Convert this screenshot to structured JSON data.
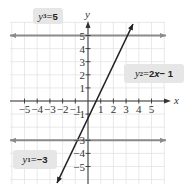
{
  "chart_data": {
    "type": "line",
    "title": "",
    "xlabel": "x",
    "ylabel": "y",
    "xlim": [
      -6,
      6
    ],
    "ylim": [
      -6,
      6
    ],
    "grid": true,
    "x_ticks": [
      -5,
      -4,
      -3,
      -2,
      -1,
      1,
      2,
      3,
      4,
      5
    ],
    "y_ticks": [
      5,
      4,
      3,
      2,
      1,
      -1,
      -3,
      -4,
      -5
    ],
    "series": [
      {
        "name": "y3 = 5",
        "equation": "y = 5",
        "color": "#8a8a8a",
        "points": [
          [
            -6,
            5
          ],
          [
            6,
            5
          ]
        ]
      },
      {
        "name": "y2 = 2x − 1",
        "equation": "y = 2x - 1",
        "color": "#222222",
        "points": [
          [
            -2.4,
            -5.8
          ],
          [
            3.5,
            6
          ]
        ]
      },
      {
        "name": "y1 = −3",
        "equation": "y = -3",
        "color": "#8a8a8a",
        "points": [
          [
            -6,
            -3
          ],
          [
            6,
            -3
          ]
        ]
      }
    ]
  },
  "labels": {
    "y3": {
      "var": "y",
      "sub": "3",
      "rest": " = ",
      "val": "5"
    },
    "y2": {
      "var": "y",
      "sub": "2",
      "rest": " = ",
      "val": "2",
      "x": "x",
      "tail": " − 1"
    },
    "y1": {
      "var": "y",
      "sub": "1",
      "rest": " = ",
      "val": "−3"
    }
  },
  "axes": {
    "x_label": "x",
    "y_label": "y",
    "x_tick_labels": [
      "−5",
      "−4",
      "−3",
      "−2",
      "−1",
      "1",
      "2",
      "3",
      "4",
      "5"
    ],
    "y_tick_labels_pos": [
      "5",
      "4",
      "3",
      "2",
      "1"
    ],
    "y_tick_labels_neg": [
      "−1",
      "−3",
      "−4",
      "−5"
    ]
  },
  "colors": {
    "grid": "#e3e3e3",
    "axis": "#333333",
    "horizontal_lines": "#8a8a8a",
    "slope_line": "#222222",
    "label_bg": "#e6e6e6"
  }
}
